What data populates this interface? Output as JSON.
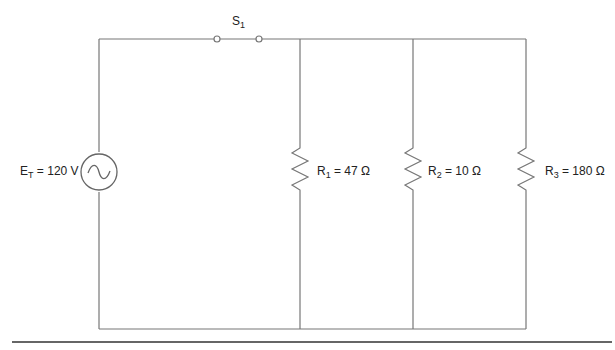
{
  "diagram": {
    "type": "parallel circuit schematic",
    "source": {
      "symbol": "E",
      "subscript": "T",
      "value": "= 120 V",
      "icon": "ac-source-icon"
    },
    "switch": {
      "symbol": "S",
      "subscript": "1"
    },
    "resistors": [
      {
        "symbol": "R",
        "subscript": "1",
        "value": "= 47 Ω"
      },
      {
        "symbol": "R",
        "subscript": "2",
        "value": "= 10 Ω"
      },
      {
        "symbol": "R",
        "subscript": "3",
        "value": "= 180 Ω"
      }
    ],
    "colors": {
      "wire": "#777777",
      "separator": "#333333",
      "text": "#222222"
    }
  }
}
